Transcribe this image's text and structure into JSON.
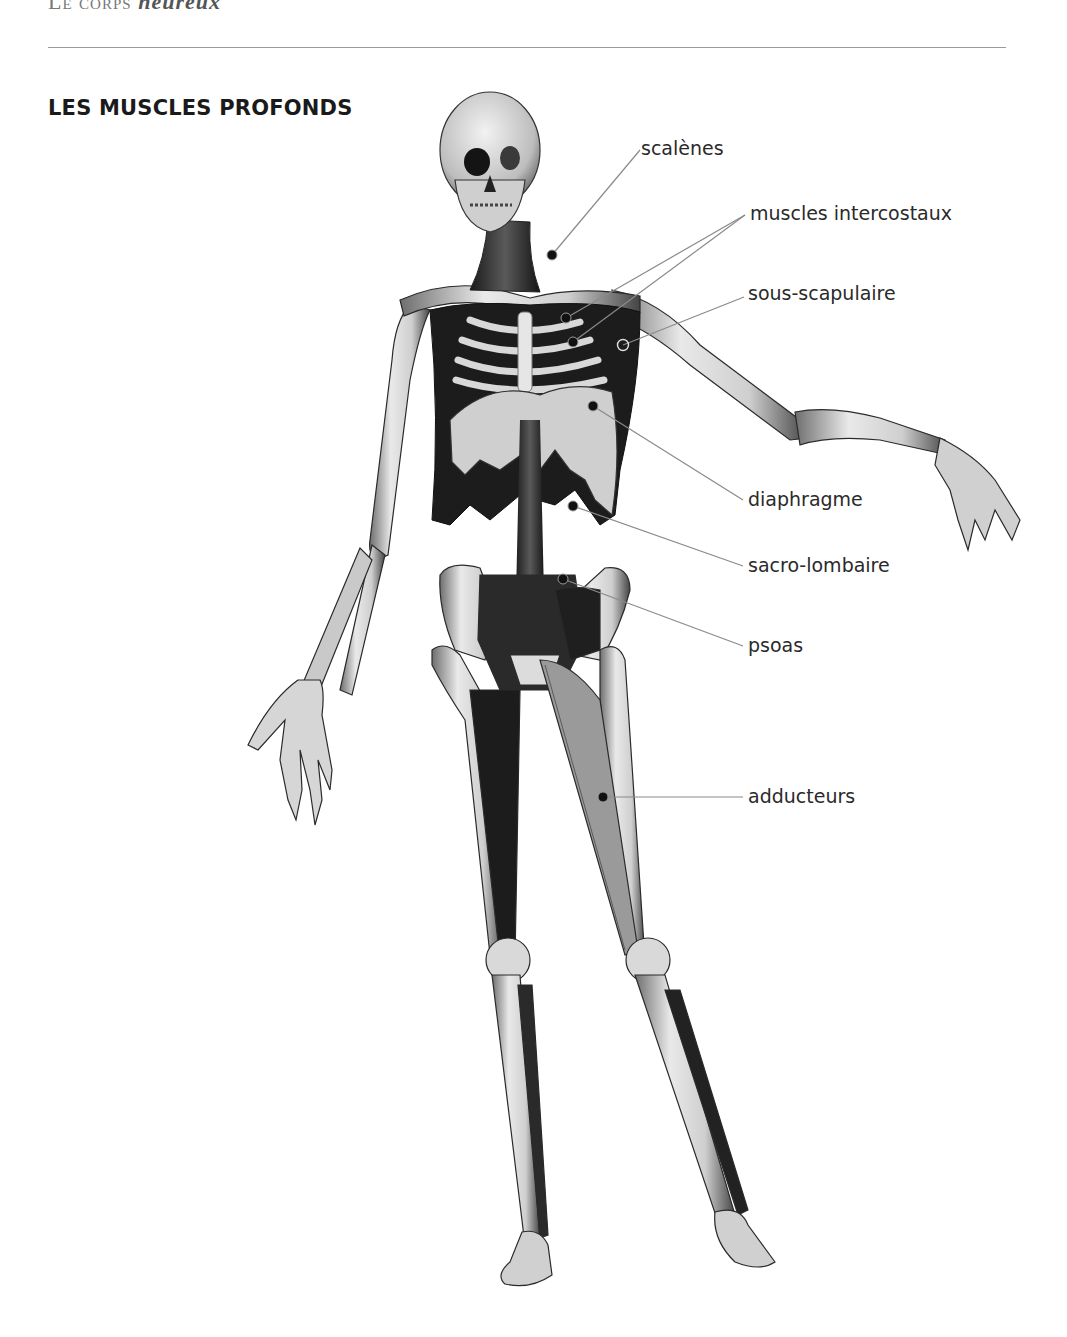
{
  "running_header": {
    "caps": "Le corps",
    "italic": "heureux"
  },
  "section_title": "LES MUSCLES PROFONDS",
  "labels": [
    {
      "id": "scalenes",
      "text": "scalènes",
      "x": 641,
      "y": 139
    },
    {
      "id": "intercostaux",
      "text": "muscles intercostaux",
      "x": 750,
      "y": 204
    },
    {
      "id": "sous-scapulaire",
      "text": "sous-scapulaire",
      "x": 748,
      "y": 284
    },
    {
      "id": "diaphragme",
      "text": "diaphragme",
      "x": 748,
      "y": 490
    },
    {
      "id": "sacro-lombaire",
      "text": "sacro-lombaire",
      "x": 748,
      "y": 556
    },
    {
      "id": "psoas",
      "text": "psoas",
      "x": 748,
      "y": 636
    },
    {
      "id": "adducteurs",
      "text": "adducteurs",
      "x": 748,
      "y": 787
    }
  ],
  "markers": [
    {
      "for": "scalenes",
      "x": 552,
      "y": 255,
      "type": "filled",
      "line_to": [
        640,
        150
      ]
    },
    {
      "for": "intercostaux",
      "x": 566,
      "y": 318,
      "type": "filled",
      "line_to": [
        745,
        215
      ]
    },
    {
      "for": "intercostaux",
      "x": 573,
      "y": 342,
      "type": "filled",
      "line_to": [
        745,
        215
      ]
    },
    {
      "for": "sous-scapulaire",
      "x": 623,
      "y": 345,
      "type": "hollow",
      "line_to": [
        744,
        297
      ]
    },
    {
      "for": "diaphragme",
      "x": 593,
      "y": 406,
      "type": "filled",
      "line_to": [
        743,
        500
      ]
    },
    {
      "for": "sacro-lombaire",
      "x": 573,
      "y": 506,
      "type": "filled",
      "line_to": [
        743,
        566
      ]
    },
    {
      "for": "psoas",
      "x": 563,
      "y": 579,
      "type": "filled",
      "line_to": [
        743,
        646
      ]
    },
    {
      "for": "adducteurs",
      "x": 603,
      "y": 797,
      "type": "filled",
      "line_to": [
        743,
        797
      ]
    }
  ],
  "colors": {
    "text": "#2a2a2a",
    "leader": "#8a8a8a",
    "marker": "#111111",
    "rule": "#9a9a9a"
  }
}
